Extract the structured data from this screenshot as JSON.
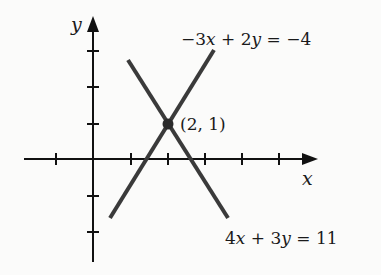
{
  "diagram": {
    "type": "coordinate-plane",
    "axes": {
      "x_label": "x",
      "y_label": "y",
      "x_ticks": [
        -1,
        1,
        2,
        3,
        4,
        5
      ],
      "y_ticks": [
        -2,
        -1,
        1,
        2,
        3
      ]
    },
    "lines": [
      {
        "equation": "−3x + 2y = −4",
        "label_parts": [
          "−3",
          "x",
          " + 2",
          "y",
          " = −4"
        ]
      },
      {
        "equation": "4x + 3y = 11",
        "label_parts": [
          "4",
          "x",
          " + 3",
          "y",
          " = 11"
        ]
      }
    ],
    "intersection": {
      "label": "(2, 1)",
      "x": 2,
      "y": 1
    }
  },
  "colors": {
    "axis": "#111111",
    "line": "#3a3a3a",
    "point": "#2a2a2a",
    "background": "#fbfbfa"
  }
}
